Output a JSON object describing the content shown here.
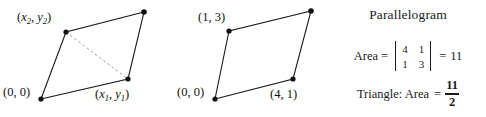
{
  "figure": {
    "background_color": "#ffffff",
    "stroke_color": "#1a1a1a",
    "text_color": "#1a1a1a",
    "shapes": [
      {
        "name": "parallelogram-general",
        "vertices": [
          {
            "label_key": "origin",
            "x": 41,
            "y": 99
          },
          {
            "label_key": "x1y1",
            "x": 128,
            "y": 79
          },
          {
            "label_key": "topright",
            "x": 144,
            "y": 12
          },
          {
            "label_key": "x2y2",
            "x": 66,
            "y": 32
          }
        ],
        "diagonal": {
          "from": [
            66,
            32
          ],
          "to": [
            128,
            79
          ],
          "style": "dashed"
        }
      },
      {
        "name": "parallelogram-numeric",
        "vertices": [
          {
            "label_key": "origin",
            "x": 215,
            "y": 99
          },
          {
            "label_key": "p41",
            "x": 293,
            "y": 79
          },
          {
            "label_key": "topright",
            "x": 311,
            "y": 11
          },
          {
            "label_key": "p13",
            "x": 229,
            "y": 31
          }
        ],
        "diagonal": null
      }
    ]
  },
  "labels": {
    "shape1": {
      "vertex_x2y2": {
        "open": "(",
        "v1": "x",
        "s1": "2",
        "comma": ", ",
        "v2": "y",
        "s2": "2",
        "close": ")"
      },
      "vertex_x1y1": {
        "open": "(",
        "v1": "x",
        "s1": "1",
        "comma": ", ",
        "v2": "y",
        "s2": "1",
        "close": ")"
      },
      "vertex_origin": "(0, 0)"
    },
    "shape2": {
      "vertex_top": "(1, 3)",
      "vertex_origin": "(0, 0)",
      "vertex_bottom_right": "(4, 1)"
    }
  },
  "formulas": {
    "heading": "Parallelogram",
    "area_label": "Area",
    "equals_1": "=",
    "matrix": {
      "rows": [
        [
          "4",
          "1"
        ],
        [
          "1",
          "3"
        ]
      ]
    },
    "equals_2": "=",
    "area_value": "11",
    "triangle_label": "Triangle: Area",
    "triangle_equals": "=",
    "triangle_fraction": {
      "numerator": "11",
      "denominator": "2"
    }
  }
}
